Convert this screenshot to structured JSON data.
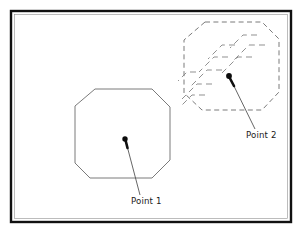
{
  "figure": {
    "background_color": "#ffffff",
    "frame": {
      "name": "diagram-border",
      "stroke_color": "#111111",
      "x": 11,
      "y": 11,
      "width": 280,
      "height": 211
    }
  },
  "callouts": [
    {
      "id": "point-1",
      "label": "Point 1",
      "dot": {
        "x": 125,
        "y": 139
      },
      "leader_end": {
        "x": 140,
        "y": 195
      },
      "label_position": {
        "x": 131,
        "y": 197
      }
    },
    {
      "id": "point-2",
      "label": "Point 2",
      "dot": {
        "x": 229,
        "y": 76
      },
      "leader_end": {
        "x": 255,
        "y": 129
      },
      "label_position": {
        "x": 246,
        "y": 131
      }
    }
  ],
  "shapes": [
    {
      "id": "solid-octagon",
      "name": "solid-octagon-shape",
      "style": "solid",
      "stroke_color": "#6b6b6b",
      "points": "95,89 152,89 170,107 170,160 152,178 90,178 75,163 75,106"
    },
    {
      "id": "dashed-octagon",
      "name": "dashed-octagon-shape",
      "style": "dashed",
      "stroke_color": "#7a7a7a",
      "points": "205,22 262,22 279,39 279,92 262,110 202,110 184,93 184,40"
    }
  ],
  "motion_trails": {
    "name": "motion-trail-lines",
    "style": "dashed",
    "stroke_color": "#8a8a8a",
    "paths": [
      "M 257,35 L 243,35 L 230,48",
      "M 265,45 L 249,45 L 232,62",
      "M 252,57 L 238,57 L 222,73",
      "M 235,45 L 222,45 L 208,59",
      "M 228,57 L 214,57 L 199,72",
      "M 222,70 L 207,70 L 191,86",
      "M 212,84 L 197,84 L 182,99",
      "M 205,95 L 192,95 L 180,107",
      "M 196,72 L 187,72 L 178,81"
    ]
  }
}
